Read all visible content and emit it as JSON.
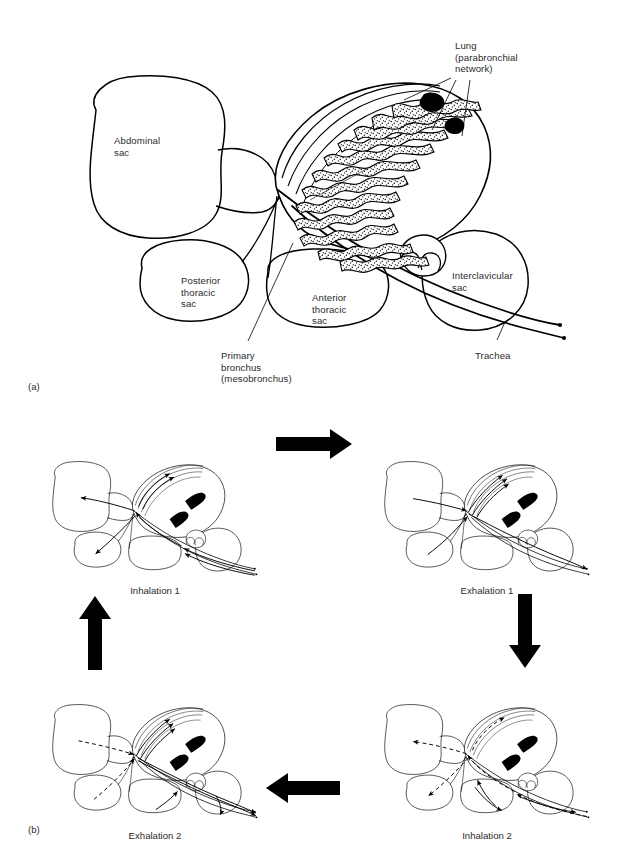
{
  "figure": {
    "stroke_color": "#000000",
    "text_color": "#2b2b2b",
    "background": "#ffffff"
  },
  "panel_a": {
    "tag": "(a)",
    "labels": [
      {
        "id": "lung",
        "text": "Lung\n(parabronchial\nnetwork)",
        "x": 455,
        "y": 40
      },
      {
        "id": "abdominal_sac",
        "text": "Abdominal\nsac",
        "x": 114,
        "y": 135
      },
      {
        "id": "posterior_thoracic_sac",
        "text": "Posterior\nthoracic\nsac",
        "x": 181,
        "y": 275
      },
      {
        "id": "anterior_thoracic_sac",
        "text": "Anterior\nthoracic\nsac",
        "x": 312,
        "y": 292
      },
      {
        "id": "interclavicular_sac",
        "text": "Interclavicular\nsac",
        "x": 452,
        "y": 270
      },
      {
        "id": "primary_bronchus",
        "text": "Primary\nbronchus\n(mesobronchus)",
        "x": 221,
        "y": 350
      },
      {
        "id": "trachea",
        "text": "Trachea",
        "x": 475,
        "y": 350
      }
    ]
  },
  "panel_b": {
    "tag": "(b)",
    "stages": [
      {
        "id": "inhalation-1",
        "label": "Inhalation 1",
        "x": 155,
        "y": 585
      },
      {
        "id": "exhalation-1",
        "label": "Exhalation 1",
        "x": 487,
        "y": 585
      },
      {
        "id": "inhalation-2",
        "label": "Inhalation 2",
        "x": 487,
        "y": 830
      },
      {
        "id": "exhalation-2",
        "label": "Exhalation 2",
        "x": 155,
        "y": 830
      }
    ],
    "cycle_arrows": [
      {
        "id": "arrow-top-right",
        "direction": "right"
      },
      {
        "id": "arrow-right-down",
        "direction": "down"
      },
      {
        "id": "arrow-bottom-left",
        "direction": "left"
      },
      {
        "id": "arrow-left-up",
        "direction": "up"
      }
    ]
  }
}
